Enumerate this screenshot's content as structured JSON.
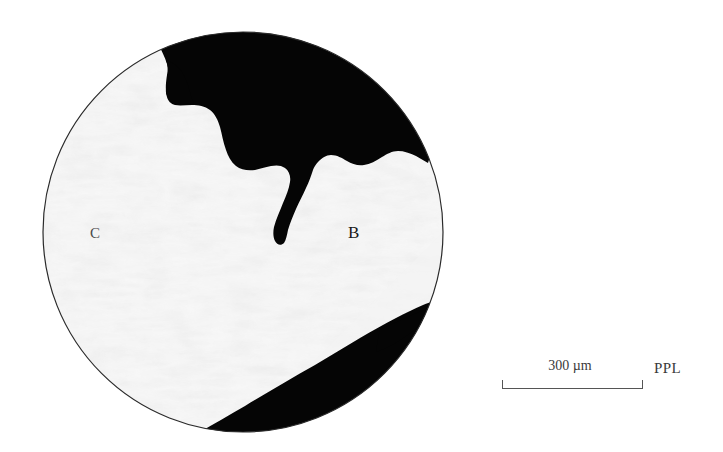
{
  "figure": {
    "kind": "photomicrograph",
    "background_color": "#ffffff"
  },
  "micrograph": {
    "field_of_view": {
      "shape": "circle",
      "center_x": 243,
      "center_y": 232,
      "radius": 200,
      "outline_color": "#2a2a2a",
      "matrix_color": "#fbfbfb",
      "opaque_phase_color": "#000000"
    },
    "labels": [
      {
        "id": "c",
        "text": "C",
        "x": 97,
        "y": 234
      },
      {
        "id": "b",
        "text": "B",
        "x": 356,
        "y": 233
      }
    ]
  },
  "scale_bar": {
    "value": "300 µm",
    "length_px": 141,
    "tick_height_px": 9,
    "line_color": "#555555"
  },
  "annotations": {
    "light_mode": "PPL"
  }
}
